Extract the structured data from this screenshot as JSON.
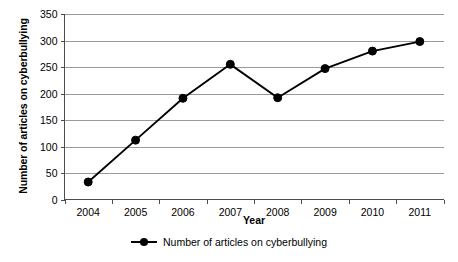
{
  "chart_data": {
    "type": "line",
    "title": "",
    "xlabel": "Year",
    "ylabel": "Number of articles on cyberbullying",
    "categories": [
      "2004",
      "2005",
      "2006",
      "2007",
      "2008",
      "2009",
      "2010",
      "2011"
    ],
    "values": [
      33,
      112,
      191,
      255,
      192,
      247,
      280,
      298
    ],
    "series": [
      {
        "name": "Number of articles on cyberbullying",
        "values": [
          33,
          112,
          191,
          255,
          192,
          247,
          280,
          298
        ]
      }
    ],
    "ylim": [
      0,
      350
    ],
    "ytick_labels": [
      "0",
      "50",
      "100",
      "150",
      "200",
      "250",
      "300",
      "350"
    ],
    "ytick_values": [
      0,
      50,
      100,
      150,
      200,
      250,
      300,
      350
    ],
    "grid": "horizontal",
    "legend_position": "bottom",
    "marker": "filled-circle",
    "line_color": "#000000",
    "grid_color": "#9a9a9a",
    "background_color": "#ffffff"
  },
  "legend": {
    "entries": [
      {
        "label": "Number of articles on cyberbullying",
        "marker": "line-with-dot-marker"
      }
    ]
  },
  "axes": {
    "y_title": "Number of articles on cyberbullying",
    "x_title": "Year"
  }
}
